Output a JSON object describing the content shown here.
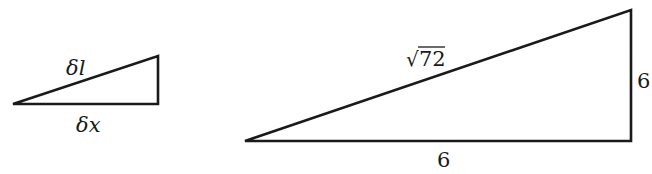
{
  "small_triangle": {
    "hypotenuse_label": "δl",
    "base_label": "δx",
    "vertices": {
      "tip": [
        13,
        104
      ],
      "base_right": [
        158,
        104
      ],
      "top_right": [
        158,
        56
      ]
    }
  },
  "large_triangle": {
    "hypotenuse_label_radicand": "72",
    "hypotenuse_label_radical": "√",
    "height_label": "6",
    "base_label": "6",
    "vertices": {
      "tip": [
        245,
        141
      ],
      "base_right": [
        631,
        141
      ],
      "top_right": [
        631,
        10
      ]
    }
  },
  "colors": {
    "stroke": "#1a1a1a",
    "background": "#ffffff"
  }
}
